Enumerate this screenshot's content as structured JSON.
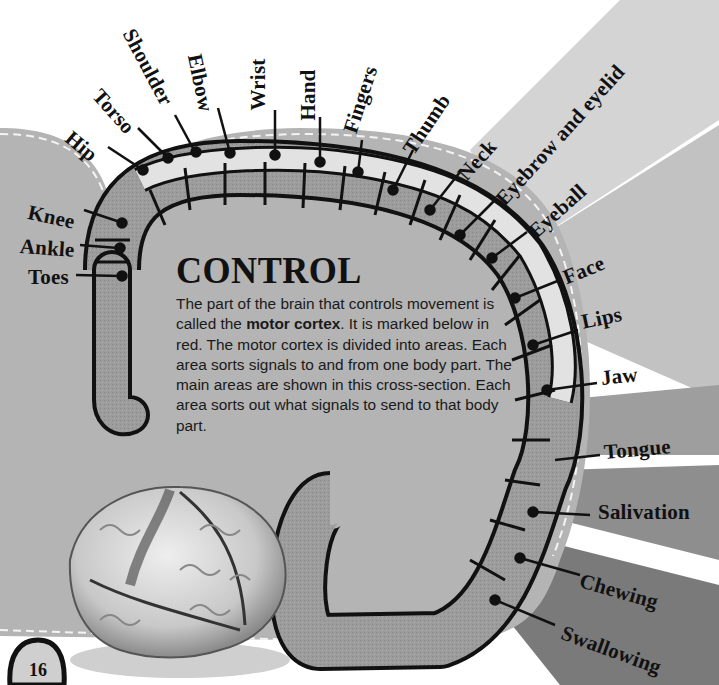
{
  "title": "CONTROL",
  "body": {
    "before": "The part of the brain that controls movement is called the ",
    "bold": "motor cortex",
    "after": ". It is marked below in red. The motor cortex is divided into areas. Each area sorts signals to and from one body part. The main areas are shown in this cross-section. Each area sorts out what signals to send to that body part."
  },
  "labels": {
    "shoulder": "Shoulder",
    "elbow": "Elbow",
    "wrist": "Wrist",
    "hand": "Hand",
    "fingers": "Fingers",
    "torso": "Torso",
    "hip": "Hip",
    "thumb": "Thumb",
    "neck": "Neck",
    "eyebrow": "Eyebrow and eyelid",
    "eyeball": "Eyeball",
    "knee": "Knee",
    "ankle": "Ankle",
    "toes": "Toes",
    "face": "Face",
    "lips": "Lips",
    "jaw": "Jaw",
    "tongue": "Tongue",
    "salivation": "Salivation",
    "chewing": "Chewing",
    "swallowing": "Swallowing"
  },
  "page_number": "16",
  "colors": {
    "panel": "#b4b4b4",
    "cortex_outer": "#d8d8d8",
    "cortex_inner": "#9a9a9a",
    "outline": "#111111"
  }
}
